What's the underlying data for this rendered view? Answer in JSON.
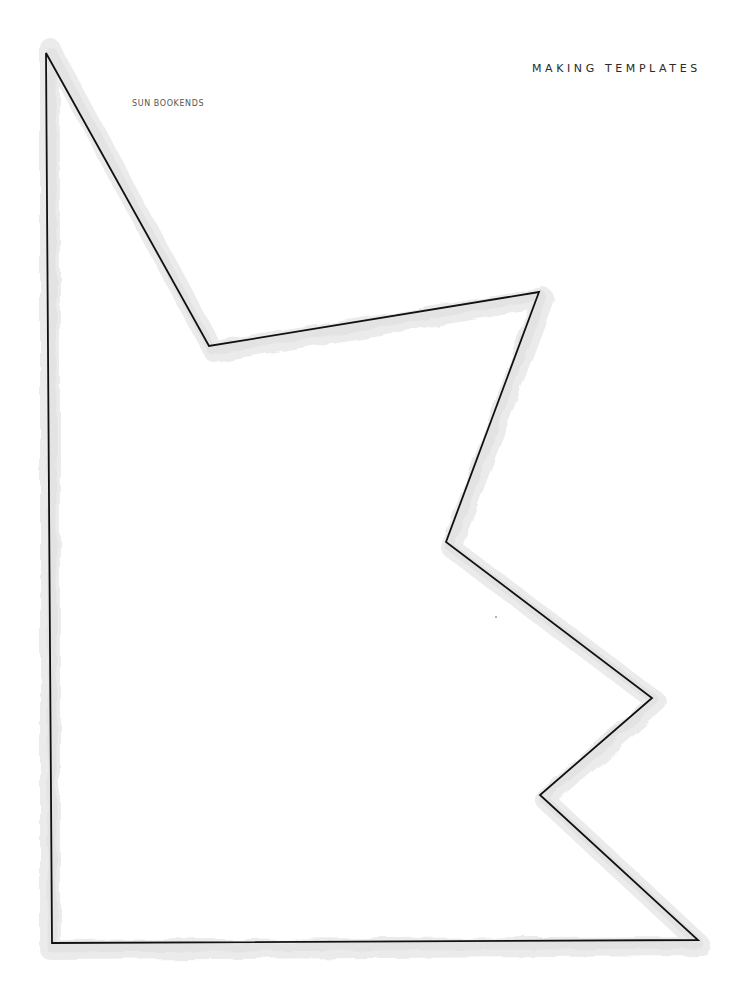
{
  "page": {
    "section_title": "MAKING TEMPLATES",
    "template_label": "SUN BOOKENDS"
  },
  "template": {
    "shape": "sun-bookend-outline",
    "outline_color": "#111111",
    "shadow_color": "#ececec",
    "vertices": [
      [
        46,
        53
      ],
      [
        209,
        346
      ],
      [
        539,
        292
      ],
      [
        446,
        542
      ],
      [
        652,
        698
      ],
      [
        540,
        795
      ],
      [
        698,
        940
      ],
      [
        52,
        943
      ]
    ]
  }
}
